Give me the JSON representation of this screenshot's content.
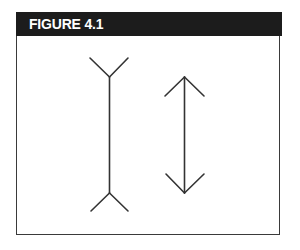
{
  "figure": {
    "title": "FIGURE 4.1",
    "header_color": "#1c1c1c",
    "line_color": "#333333",
    "illustration": "Müller-Lyer illusion"
  },
  "lines": [
    {
      "name": "fins-outward-line",
      "shaft": {
        "x1": 109.5,
        "y1": 77,
        "x2": 109.5,
        "y2": 193
      },
      "ends": "fins pointing outward (Y shapes)",
      "segments": [
        {
          "x1": 90,
          "y1": 58,
          "x2": 109.5,
          "y2": 77
        },
        {
          "x1": 128,
          "y1": 58,
          "x2": 109.5,
          "y2": 77
        },
        {
          "x1": 109.5,
          "y1": 193,
          "x2": 91,
          "y2": 211
        },
        {
          "x1": 109.5,
          "y1": 193,
          "x2": 128,
          "y2": 211
        }
      ]
    },
    {
      "name": "arrowheads-line",
      "shaft": {
        "x1": 184.5,
        "y1": 77,
        "x2": 184.5,
        "y2": 193
      },
      "ends": "arrowheads pointing outward",
      "segments": [
        {
          "x1": 184.5,
          "y1": 77,
          "x2": 165,
          "y2": 96
        },
        {
          "x1": 184.5,
          "y1": 77,
          "x2": 204,
          "y2": 96
        },
        {
          "x1": 184.5,
          "y1": 193,
          "x2": 166,
          "y2": 174
        },
        {
          "x1": 184.5,
          "y1": 193,
          "x2": 204,
          "y2": 174
        }
      ]
    }
  ]
}
